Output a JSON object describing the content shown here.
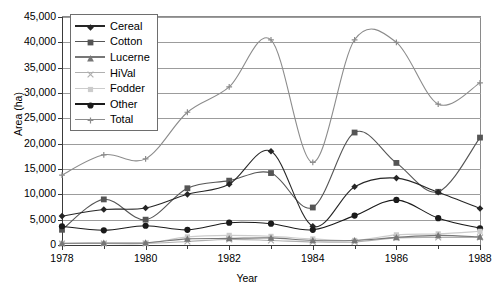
{
  "chart_data": {
    "type": "line",
    "title": "",
    "xlabel": "Year",
    "ylabel": "Area (ha)",
    "x": [
      1978,
      1979,
      1980,
      1981,
      1982,
      1983,
      1984,
      1985,
      1986,
      1987,
      1988
    ],
    "xlim": [
      1978,
      1988
    ],
    "ylim": [
      0,
      45000
    ],
    "x_tick_labels": [
      "1978",
      "1980",
      "1982",
      "1984",
      "1986",
      "1988"
    ],
    "y_tick_labels": [
      "0",
      "5,000",
      "10,000",
      "15,000",
      "20,000",
      "25,000",
      "30,000",
      "35,000",
      "40,000",
      "45,000"
    ],
    "y_tick_values": [
      0,
      5000,
      10000,
      15000,
      20000,
      25000,
      30000,
      35000,
      40000,
      45000
    ],
    "grid": true,
    "legend_position": "top-left",
    "series": [
      {
        "name": "Cereal",
        "marker": "diamond",
        "color": "#262626",
        "values": [
          5700,
          7000,
          7300,
          10000,
          12000,
          18500,
          3700,
          11500,
          13200,
          10400,
          7200
        ]
      },
      {
        "name": "Cotton",
        "marker": "square",
        "color": "#555555",
        "values": [
          3000,
          9000,
          5000,
          11200,
          12700,
          14200,
          7400,
          22200,
          16200,
          10500,
          21200
        ]
      },
      {
        "name": "Lucerne",
        "marker": "triangle",
        "color": "#777777",
        "values": [
          350,
          400,
          450,
          1200,
          1300,
          1400,
          900,
          900,
          1500,
          1900,
          1600
        ]
      },
      {
        "name": "HiVal",
        "marker": "cross",
        "color": "#b0b0b0",
        "values": [
          300,
          300,
          300,
          700,
          1100,
          900,
          600,
          600,
          1400,
          1500,
          1500
        ]
      },
      {
        "name": "Fodder",
        "marker": "filled-square",
        "color": "#cccccc",
        "values": [
          300,
          300,
          350,
          1600,
          1900,
          1700,
          1200,
          900,
          2000,
          2200,
          2700
        ]
      },
      {
        "name": "Other",
        "marker": "circle",
        "color": "#1a1a1a",
        "values": [
          3700,
          2900,
          3800,
          3000,
          4400,
          4200,
          3000,
          5800,
          8900,
          5300,
          3300
        ]
      },
      {
        "name": "Total",
        "marker": "plus",
        "color": "#8c8c8c",
        "smooth": true,
        "values": [
          13800,
          17800,
          17000,
          26200,
          31200,
          40500,
          16300,
          40500,
          40000,
          27800,
          32000
        ]
      }
    ]
  },
  "legend": {
    "items": [
      {
        "label": "Cereal"
      },
      {
        "label": "Cotton"
      },
      {
        "label": "Lucerne"
      },
      {
        "label": "HiVal"
      },
      {
        "label": "Fodder"
      },
      {
        "label": "Other"
      },
      {
        "label": "Total"
      }
    ]
  }
}
